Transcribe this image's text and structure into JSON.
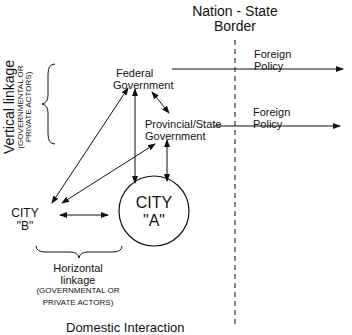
{
  "border": {
    "line1": "Nation - State",
    "line2": "Border"
  },
  "federal": {
    "line1": "Federal",
    "line2": "Government"
  },
  "provincial": {
    "line1": "Provincial/State",
    "line2": "Government"
  },
  "foreign_policy_1": {
    "line1": "Foreign",
    "line2": "Policy"
  },
  "foreign_policy_2": {
    "line1": "Foreign",
    "line2": "Policy"
  },
  "city_a": {
    "line1": "CITY",
    "line2": "\"A\""
  },
  "city_b": {
    "line1": "CITY",
    "line2": "\"B\""
  },
  "vertical_linkage": {
    "title": "Vertical linkage",
    "sub1": "(GOVERNMENTAL OR",
    "sub2": "PRIVATE ACTORS)"
  },
  "horizontal_linkage": {
    "line1": "Horizontal",
    "line2": "linkage",
    "sub1": "(GOVERNMENTAL OR",
    "sub2": "PRIVATE ACTORS)"
  },
  "footer_partial": "Domestic Interaction"
}
